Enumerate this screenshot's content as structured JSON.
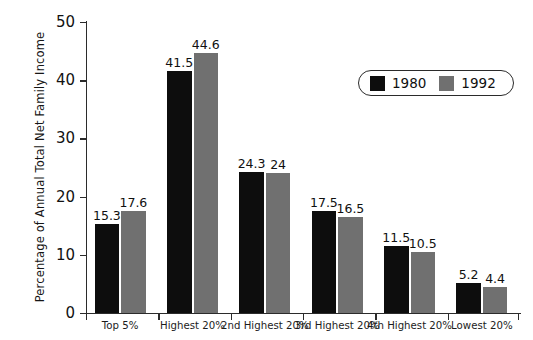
{
  "chart_data": {
    "type": "bar",
    "title": "",
    "xlabel": "",
    "ylabel": "Percentage of Annual Total Net Family Income",
    "ylim": [
      0,
      50
    ],
    "yticks": [
      0,
      10,
      20,
      30,
      40,
      50
    ],
    "ytick_labels": [
      "0",
      "10",
      "20",
      "30",
      "40",
      "50"
    ],
    "grid": false,
    "legend_position": "upper right",
    "categories": [
      "Top 5%",
      "Highest 20%",
      "2nd Highest 20%",
      "3rd Highest 20%",
      "4th Highest 20%",
      "Lowest 20%"
    ],
    "series": [
      {
        "name": "1980",
        "color": "#0d0d0d",
        "values": [
          15.3,
          41.5,
          24.3,
          17.5,
          11.5,
          5.2
        ],
        "value_labels": [
          "15.3",
          "41.5",
          "24.3",
          "17.5",
          "11.5",
          "5.2"
        ]
      },
      {
        "name": "1992",
        "color": "#707070",
        "values": [
          17.6,
          44.6,
          24.0,
          16.5,
          10.5,
          4.4
        ],
        "value_labels": [
          "17.6",
          "44.6",
          "24",
          "16.5",
          "10.5",
          "4.4"
        ]
      }
    ]
  },
  "legend": {
    "items": [
      {
        "label": "1980",
        "color": "#0d0d0d"
      },
      {
        "label": "1992",
        "color": "#707070"
      }
    ]
  }
}
